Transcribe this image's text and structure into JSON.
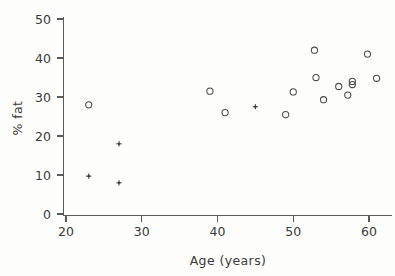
{
  "chart_data": {
    "type": "scatter",
    "title": "",
    "subtitle": "",
    "xlabel": "Age (years)",
    "ylabel": "% fat",
    "xlim": [
      18.5,
      62.5
    ],
    "ylim": [
      -1.5,
      52
    ],
    "xticks": [
      20,
      30,
      40,
      50,
      60
    ],
    "xtick_labels": [
      "20",
      "30",
      "40",
      "50",
      "60"
    ],
    "yticks": [
      0,
      10,
      20,
      30,
      40,
      50
    ],
    "ytick_labels": [
      "0",
      "10",
      "20",
      "30",
      "40",
      "50"
    ],
    "grid": false,
    "legend": null,
    "legend_position": "none",
    "marker_colors": {
      "circle": "#4a4a4a",
      "cross": "#3a3a3a"
    },
    "series": [
      {
        "name": "circle-group",
        "marker": "open-circle",
        "points": [
          {
            "x": 23.0,
            "y": 28.0
          },
          {
            "x": 39.0,
            "y": 31.5
          },
          {
            "x": 41.0,
            "y": 26.0
          },
          {
            "x": 49.0,
            "y": 25.5
          },
          {
            "x": 50.0,
            "y": 31.3
          },
          {
            "x": 52.8,
            "y": 42.0
          },
          {
            "x": 53.0,
            "y": 35.0
          },
          {
            "x": 54.0,
            "y": 29.3
          },
          {
            "x": 56.0,
            "y": 32.7
          },
          {
            "x": 57.2,
            "y": 30.5
          },
          {
            "x": 57.8,
            "y": 34.0
          },
          {
            "x": 57.8,
            "y": 33.2
          },
          {
            "x": 59.8,
            "y": 41.0
          },
          {
            "x": 61.0,
            "y": 34.8
          }
        ]
      },
      {
        "name": "cross-group",
        "marker": "plus",
        "points": [
          {
            "x": 23.0,
            "y": 9.7
          },
          {
            "x": 27.0,
            "y": 18.0
          },
          {
            "x": 27.0,
            "y": 8.0
          },
          {
            "x": 45.0,
            "y": 27.5
          }
        ]
      }
    ]
  },
  "figure": {
    "background_color": "#fdfdfc",
    "axis_color": "#5a5a5a",
    "text_color": "#3a3a3a"
  }
}
